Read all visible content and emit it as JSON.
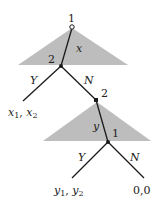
{
  "diagram": {
    "type": "game-tree",
    "colors": {
      "info_set": "#bdbdbd",
      "edge": "#1a1a1a",
      "background": "#ffffff"
    },
    "nodes": {
      "root": {
        "player": "1",
        "action_var": "x"
      },
      "second_in_first_set": {
        "player": "2"
      },
      "second_stage_root": {
        "player": "2",
        "action_var": "y"
      },
      "second_stage_node": {
        "player": "1"
      }
    },
    "edges": {
      "first_yes": "Y",
      "first_no": "N",
      "second_yes": "Y",
      "second_no": "N"
    },
    "payoffs": {
      "first_yes": {
        "p1": "x",
        "p1_sub": "1",
        "sep": ", ",
        "p2": "x",
        "p2_sub": "2"
      },
      "second_yes": {
        "p1": "y",
        "p1_sub": "1",
        "sep": ", ",
        "p2": "y",
        "p2_sub": "2"
      },
      "second_no": "0,0"
    }
  }
}
